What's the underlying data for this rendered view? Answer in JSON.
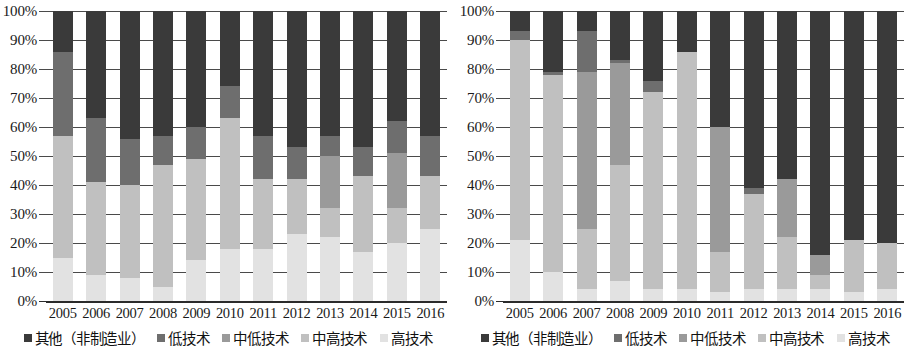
{
  "colors": {
    "other": "#3a3a3a",
    "low": "#6e6e6e",
    "medlow": "#9a9a9a",
    "medhigh": "#c0c0c0",
    "high": "#e2e2e2",
    "gridline": "#4a4a4a",
    "axis": "#2b2b2b",
    "text": "#1a1a1a"
  },
  "legend": {
    "items": [
      {
        "label": "其他（非制造业）",
        "color_key": "other",
        "icon": "square-swatch"
      },
      {
        "label": "低技术",
        "color_key": "low",
        "icon": "square-swatch"
      },
      {
        "label": "中低技术",
        "color_key": "medlow",
        "icon": "square-swatch"
      },
      {
        "label": "中高技术",
        "color_key": "medhigh",
        "icon": "square-swatch"
      },
      {
        "label": "高技术",
        "color_key": "high",
        "icon": "square-swatch"
      }
    ]
  },
  "axis": {
    "y_ticks": [
      "0%",
      "10%",
      "20%",
      "30%",
      "40%",
      "50%",
      "60%",
      "70%",
      "80%",
      "90%",
      "100%"
    ],
    "y_min": 0,
    "y_max": 100
  },
  "chart_data": [
    {
      "id": "left",
      "type": "bar",
      "stacked": true,
      "title": "",
      "xlabel": "",
      "ylabel": "",
      "ylim": [
        0,
        100
      ],
      "grid": true,
      "legend_position": "bottom",
      "categories": [
        "2005",
        "2006",
        "2007",
        "2008",
        "2009",
        "2010",
        "2011",
        "2012",
        "2013",
        "2014",
        "2015",
        "2016"
      ],
      "series": [
        {
          "name": "高技术",
          "color_key": "high",
          "values": [
            15,
            9,
            8,
            5,
            14,
            18,
            18,
            23,
            22,
            17,
            20,
            25
          ]
        },
        {
          "name": "中高技术",
          "color_key": "medhigh",
          "values": [
            42,
            32,
            32,
            42,
            35,
            45,
            24,
            19,
            10,
            26,
            12,
            18
          ]
        },
        {
          "name": "中低技术",
          "color_key": "medlow",
          "values": [
            0,
            0,
            0,
            0,
            0,
            0,
            0,
            0,
            18,
            0,
            19,
            0
          ]
        },
        {
          "name": "低技术",
          "color_key": "low",
          "values": [
            29,
            22,
            16,
            10,
            11,
            11,
            15,
            11,
            7,
            10,
            11,
            14
          ]
        },
        {
          "name": "其他（非制造业）",
          "color_key": "other",
          "values": [
            14,
            37,
            44,
            43,
            40,
            26,
            43,
            47,
            43,
            47,
            38,
            43
          ]
        }
      ]
    },
    {
      "id": "right",
      "type": "bar",
      "stacked": true,
      "title": "",
      "xlabel": "",
      "ylabel": "",
      "ylim": [
        0,
        100
      ],
      "grid": true,
      "legend_position": "bottom",
      "categories": [
        "2005",
        "2006",
        "2007",
        "2008",
        "2009",
        "2010",
        "2011",
        "2012",
        "2013",
        "2014",
        "2015",
        "2016"
      ],
      "series": [
        {
          "name": "高技术",
          "color_key": "high",
          "values": [
            21,
            10,
            4,
            7,
            4,
            4,
            3,
            4,
            4,
            4,
            3,
            4
          ]
        },
        {
          "name": "中高技术",
          "color_key": "medhigh",
          "values": [
            69,
            68,
            21,
            40,
            68,
            82,
            14,
            33,
            18,
            5,
            18,
            16
          ]
        },
        {
          "name": "中低技术",
          "color_key": "medlow",
          "values": [
            0,
            0,
            54,
            35,
            0,
            0,
            43,
            0,
            20,
            7,
            0,
            0
          ]
        },
        {
          "name": "低技术",
          "color_key": "low",
          "values": [
            3,
            1,
            14,
            1,
            4,
            0,
            0,
            2,
            0,
            0,
            0,
            0
          ]
        },
        {
          "name": "其他（非制造业）",
          "color_key": "other",
          "values": [
            7,
            21,
            7,
            17,
            24,
            14,
            40,
            61,
            58,
            84,
            79,
            80
          ]
        }
      ]
    }
  ]
}
